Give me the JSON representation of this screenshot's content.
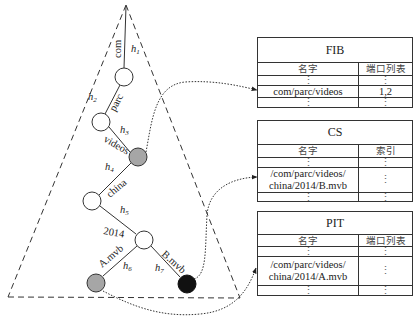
{
  "tree": {
    "edges": [
      {
        "name": "com",
        "hash": "h",
        "sub": "1"
      },
      {
        "name": "parc",
        "hash": "h",
        "sub": "2"
      },
      {
        "name": "videos",
        "hash": "h",
        "sub": "3"
      },
      {
        "name": "china",
        "hash": "h",
        "sub": "4"
      },
      {
        "name": "2014",
        "hash": "h",
        "sub": "5"
      },
      {
        "name": "A.mvb",
        "hash": "h",
        "sub": "6"
      },
      {
        "name": "B.mvb",
        "hash": "h",
        "sub": "7"
      }
    ],
    "colors": {
      "white_node": "#ffffff",
      "gray_node": "#a6a6a6",
      "black_node": "#111111"
    }
  },
  "tables": {
    "fib": {
      "title": "FIB",
      "headers": [
        "名字",
        "端口列表"
      ],
      "rows": [
        {
          "name": "⋮",
          "value": "⋮"
        },
        {
          "name": "com/parc/videos",
          "value": "1,2"
        },
        {
          "name": "⋮",
          "value": "⋮"
        }
      ]
    },
    "cs": {
      "title": "CS",
      "headers": [
        "名字",
        "索引"
      ],
      "rows": [
        {
          "name": "⋮",
          "value": "⋮"
        },
        {
          "name": "/com/parc/videos/\nchina/2014/B.mvb",
          "line1": "/com/parc/videos/",
          "line2": "china/2014/B.mvb",
          "value": "⋮"
        },
        {
          "name": "⋮",
          "value": "⋮"
        }
      ]
    },
    "pit": {
      "title": "PIT",
      "headers": [
        "名字",
        "端口列表"
      ],
      "rows": [
        {
          "name": "⋮",
          "value": "⋮"
        },
        {
          "name": "/com/parc/videos/\nchina/2014/A.mvb",
          "line1": "/com/parc/videos/",
          "line2": "china/2014/A.mvb",
          "value": "⋮"
        },
        {
          "name": "⋮",
          "value": "⋮"
        }
      ]
    }
  }
}
